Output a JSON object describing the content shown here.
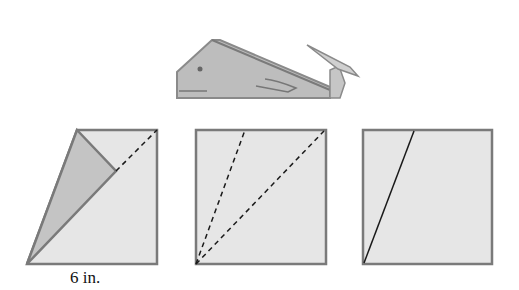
{
  "figure": {
    "whale": {
      "name": "origami whale"
    },
    "steps": [
      {
        "index": 1,
        "description": "square folded along diagonal with flap folded over",
        "dimension_label": "6 in."
      },
      {
        "index": 2,
        "description": "square with two dashed fold lines from bottom-left corner"
      },
      {
        "index": 3,
        "description": "square with one solid crease line from bottom-left corner"
      }
    ]
  },
  "colors": {
    "paper": "#e6e6e6",
    "flap": "#c4c4c4",
    "whale_body": "#bdbdbd",
    "edge": "#7a7a7a",
    "line": "#1a1a1a"
  }
}
